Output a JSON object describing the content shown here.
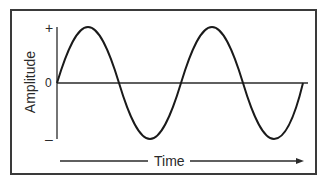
{
  "diagram": {
    "y_axis": {
      "label": "Amplitude",
      "ticks": {
        "top": "+",
        "zero": "0",
        "bottom": "–"
      }
    },
    "x_axis": {
      "label": "Time",
      "direction": "arrow-right"
    },
    "wave": {
      "type": "sine",
      "cycles": 2,
      "starts_at": "zero, rising",
      "color": "#1a1a1a"
    },
    "colors": {
      "frame": "#3a3a3a",
      "axis": "#2a2a2a",
      "background": "#ffffff"
    }
  }
}
